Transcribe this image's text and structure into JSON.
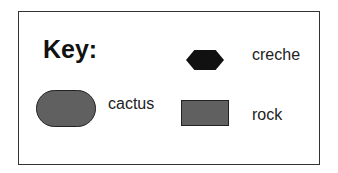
{
  "legend": {
    "title": "Key:",
    "items": [
      {
        "symbol": "hexagon",
        "label": "creche",
        "color": "#111111"
      },
      {
        "symbol": "rounded-rectangle",
        "label": "cactus",
        "color": "#606060"
      },
      {
        "symbol": "rectangle",
        "label": "rock",
        "color": "#606060"
      }
    ]
  }
}
